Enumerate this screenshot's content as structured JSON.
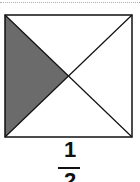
{
  "figure": {
    "shape": "square divided by both diagonals into four triangles",
    "shaded_region": "left triangle",
    "fill_color": "#6b6b6b",
    "stroke_color": "#111111"
  },
  "label": {
    "numerator": "1",
    "denominator": "2"
  }
}
